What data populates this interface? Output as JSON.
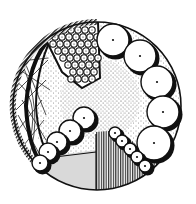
{
  "figure": {
    "description": "Circular pen-and-ink illustration of a cell/organism cross-section with textured regions",
    "colors": {
      "background": "#ffffff",
      "ink": "#111111",
      "grey_fill": "#d9d9d9",
      "stipple": "#222222"
    },
    "outer_circle": {
      "cx": 97,
      "cy": 106,
      "r": 84
    },
    "regions": [
      {
        "name": "hatched-rim",
        "texture": "diagonal hatch"
      },
      {
        "name": "net-region",
        "texture": "crossing lines"
      },
      {
        "name": "stippled-core",
        "texture": "stipple dots"
      },
      {
        "name": "honeycomb-wedge",
        "texture": "packed small circles"
      },
      {
        "name": "grey-sector",
        "texture": "solid light grey"
      },
      {
        "name": "striped-sector",
        "texture": "vertical lines"
      }
    ],
    "large_circles": [
      {
        "cx": 113,
        "cy": 40,
        "r": 16
      },
      {
        "cx": 140,
        "cy": 56,
        "r": 16
      },
      {
        "cx": 157,
        "cy": 82,
        "r": 16
      },
      {
        "cx": 163,
        "cy": 112,
        "r": 16
      },
      {
        "cx": 154,
        "cy": 143,
        "r": 17
      }
    ],
    "medium_circles": [
      {
        "cx": 84,
        "cy": 118,
        "r": 11
      },
      {
        "cx": 70,
        "cy": 131,
        "r": 11
      },
      {
        "cx": 57,
        "cy": 142,
        "r": 10
      },
      {
        "cx": 48,
        "cy": 152,
        "r": 9
      },
      {
        "cx": 40,
        "cy": 163,
        "r": 8
      }
    ],
    "small_circles": [
      {
        "cx": 115,
        "cy": 133,
        "r": 6
      },
      {
        "cx": 122,
        "cy": 141,
        "r": 6
      },
      {
        "cx": 130,
        "cy": 149,
        "r": 6
      },
      {
        "cx": 137,
        "cy": 157,
        "r": 6
      },
      {
        "cx": 145,
        "cy": 166,
        "r": 6
      }
    ]
  }
}
